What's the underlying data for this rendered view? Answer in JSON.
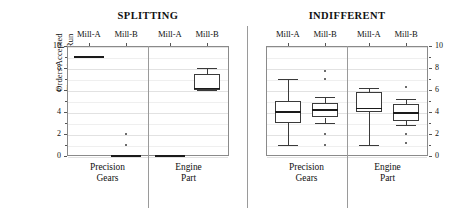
{
  "axis": {
    "y_title_line1": "Orders Accepted",
    "y_title_line2": "Throughout Run",
    "y_ticks": [
      "10",
      "8",
      "6",
      "4",
      "2",
      "0"
    ],
    "y_ticks_right": [
      "10",
      "8",
      "6",
      "4",
      "2",
      "0"
    ]
  },
  "supertitles": [
    {
      "label": "SPLITTING"
    },
    {
      "label": "INDIFFERENT"
    }
  ],
  "mill_labels": [
    {
      "label": "Mill-A"
    },
    {
      "label": "Mill-B"
    },
    {
      "label": "Mill-A"
    },
    {
      "label": "Mill-B"
    },
    {
      "label": "Mill-A"
    },
    {
      "label": "Mill-B"
    },
    {
      "label": "Mill-A"
    },
    {
      "label": "Mill-B"
    }
  ],
  "group_labels": [
    {
      "line1": "Precision",
      "line2": "Gears"
    },
    {
      "line1": "Engine",
      "line2": "Part"
    },
    {
      "line1": "Precision",
      "line2": "Gears"
    },
    {
      "line1": "Engine",
      "line2": "Part"
    }
  ],
  "chart_data": {
    "type": "box",
    "title": "",
    "ylabel": "Orders Accepted Throughout Run",
    "xlabel": "",
    "ylim": [
      0,
      10
    ],
    "ytick_values": [
      0,
      2,
      4,
      6,
      8,
      10
    ],
    "grid": true,
    "legend": "none",
    "dual_y_axis": true,
    "panels": [
      {
        "supergroup": "SPLITTING",
        "groups": [
          {
            "name": "Precision Gears",
            "boxes": [
              {
                "series": "Mill-A",
                "degenerate": true,
                "min": 9,
                "q1": 9,
                "median": 9,
                "q3": 9,
                "max": 9,
                "outliers": []
              },
              {
                "series": "Mill-B",
                "degenerate": true,
                "min": 0,
                "q1": 0,
                "median": 0,
                "q3": 0,
                "max": 0,
                "outliers": [
                  1,
                  2
                ]
              }
            ]
          },
          {
            "name": "Engine Part",
            "boxes": [
              {
                "series": "Mill-A",
                "degenerate": true,
                "min": 0,
                "q1": 0,
                "median": 0,
                "q3": 0,
                "max": 0,
                "outliers": []
              },
              {
                "series": "Mill-B",
                "degenerate": false,
                "min": 6.0,
                "q1": 6.0,
                "median": 6.15,
                "q3": 7.5,
                "max": 8.0,
                "outliers": []
              }
            ]
          }
        ]
      },
      {
        "supergroup": "INDIFFERENT",
        "groups": [
          {
            "name": "Precision Gears",
            "boxes": [
              {
                "series": "Mill-A",
                "degenerate": false,
                "min": 1.0,
                "q1": 3.0,
                "median": 4.0,
                "q3": 5.0,
                "max": 7.0,
                "outliers": []
              },
              {
                "series": "Mill-B",
                "degenerate": false,
                "min": 3.0,
                "q1": 3.5,
                "median": 4.2,
                "q3": 4.8,
                "max": 5.4,
                "outliers": [
                  7.7,
                  7.0,
                  2.0,
                  1.0
                ]
              }
            ]
          },
          {
            "name": "Engine Part",
            "boxes": [
              {
                "series": "Mill-A",
                "degenerate": false,
                "min": 1.0,
                "q1": 4.0,
                "median": 4.3,
                "q3": 5.8,
                "max": 6.2,
                "outliers": []
              },
              {
                "series": "Mill-B",
                "degenerate": false,
                "min": 2.8,
                "q1": 3.2,
                "median": 3.9,
                "q3": 4.7,
                "max": 5.2,
                "outliers": [
                  6.3,
                  2.0,
                  1.2
                ]
              }
            ]
          }
        ]
      }
    ]
  }
}
